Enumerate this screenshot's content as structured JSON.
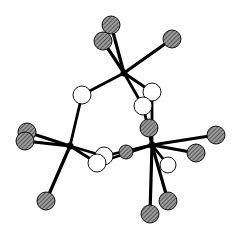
{
  "figure": {
    "type": "ball-and-stick molecular structure",
    "width": 241,
    "height": 233,
    "colors": {
      "background": "#ffffff",
      "bond": "#000000",
      "hatched_atom_fill": "#8a8a8a",
      "hatched_line": "#2a2a2a",
      "open_atom_fill": "#ffffff"
    },
    "centers": [
      {
        "id": "M1",
        "x": 124,
        "y": 73
      },
      {
        "id": "M2",
        "x": 70,
        "y": 146
      },
      {
        "id": "M3",
        "x": 152,
        "y": 145
      }
    ],
    "hatched_atoms": [
      {
        "id": "A1",
        "x": 111,
        "y": 25,
        "r": 9,
        "bond_to": "M1"
      },
      {
        "id": "A2",
        "x": 103,
        "y": 41,
        "r": 9,
        "bond_to": "M1"
      },
      {
        "id": "A3",
        "x": 172,
        "y": 39,
        "r": 9,
        "bond_to": "M1"
      },
      {
        "id": "A4",
        "x": 27,
        "y": 132,
        "r": 9,
        "bond_to": "M2"
      },
      {
        "id": "A5",
        "x": 25,
        "y": 141,
        "r": 9,
        "bond_to": "M2"
      },
      {
        "id": "A6",
        "x": 46,
        "y": 201,
        "r": 9,
        "bond_to": "M2"
      },
      {
        "id": "A7",
        "x": 149,
        "y": 128,
        "r": 9,
        "bond_to": "M3"
      },
      {
        "id": "A8",
        "x": 216,
        "y": 135,
        "r": 9,
        "bond_to": "M3"
      },
      {
        "id": "A9",
        "x": 196,
        "y": 153,
        "r": 9,
        "bond_to": "M3"
      },
      {
        "id": "A10",
        "x": 126,
        "y": 152,
        "r": 7,
        "bond_to": "M3"
      },
      {
        "id": "A11",
        "x": 168,
        "y": 201,
        "r": 9,
        "bond_to": "M3"
      },
      {
        "id": "A12",
        "x": 150,
        "y": 214,
        "r": 9,
        "bond_to": "M3"
      }
    ],
    "open_atoms": [
      {
        "id": "O1",
        "x": 82,
        "y": 95,
        "r": 9,
        "bonds": [
          "M1",
          "M2"
        ]
      },
      {
        "id": "O2",
        "x": 152,
        "y": 92,
        "r": 9,
        "bonds": [
          "M1",
          "M3"
        ]
      },
      {
        "id": "O3",
        "x": 143,
        "y": 106,
        "r": 9,
        "bonds": [
          "M1",
          "M3"
        ]
      },
      {
        "id": "O4",
        "x": 104,
        "y": 156,
        "r": 9,
        "bonds": [
          "M2",
          "M3"
        ]
      },
      {
        "id": "O5",
        "x": 97,
        "y": 163,
        "r": 9,
        "bonds": [
          "M2",
          "M3"
        ]
      },
      {
        "id": "O6",
        "x": 168,
        "y": 165,
        "r": 8,
        "bonds": [
          "M3"
        ]
      }
    ]
  }
}
